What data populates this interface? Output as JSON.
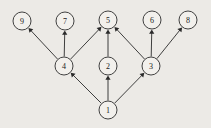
{
  "figure": {
    "type": "directed-acyclic-graph",
    "background_color": "#eceae6",
    "node_fill_color": "#f2f0ec",
    "stroke_color": "#2e2e2e",
    "width": 211,
    "height": 128,
    "node_radius": 9
  },
  "graph": {
    "nodes": [
      {
        "id": "9",
        "label": "9",
        "x": 22,
        "y": 21
      },
      {
        "id": "7",
        "label": "7",
        "x": 65,
        "y": 21
      },
      {
        "id": "5",
        "label": "5",
        "x": 108,
        "y": 20
      },
      {
        "id": "6",
        "label": "6",
        "x": 152,
        "y": 20
      },
      {
        "id": "8",
        "label": "8",
        "x": 188,
        "y": 20
      },
      {
        "id": "4",
        "label": "4",
        "x": 64,
        "y": 66
      },
      {
        "id": "2",
        "label": "2",
        "x": 108,
        "y": 66
      },
      {
        "id": "3",
        "label": "3",
        "x": 151,
        "y": 66
      },
      {
        "id": "1",
        "label": "1",
        "x": 108,
        "y": 110
      }
    ],
    "edges": [
      {
        "from": "1",
        "to": "4"
      },
      {
        "from": "1",
        "to": "2"
      },
      {
        "from": "1",
        "to": "3"
      },
      {
        "from": "4",
        "to": "9"
      },
      {
        "from": "4",
        "to": "7"
      },
      {
        "from": "4",
        "to": "5"
      },
      {
        "from": "2",
        "to": "5"
      },
      {
        "from": "3",
        "to": "5"
      },
      {
        "from": "3",
        "to": "6"
      },
      {
        "from": "3",
        "to": "8"
      }
    ]
  }
}
